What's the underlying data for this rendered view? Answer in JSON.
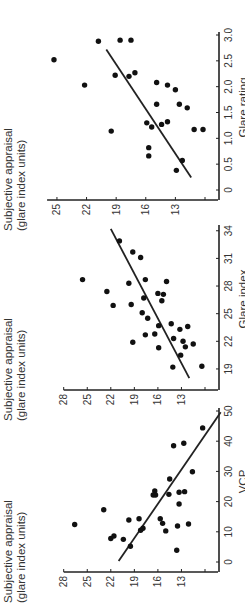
{
  "figure": {
    "panel_count": 3,
    "colors": {
      "point": "#111111",
      "axis": "#222222",
      "line": "#222222",
      "text": "#333333"
    }
  },
  "chart_data": [
    {
      "type": "scatter",
      "title": "",
      "xlabel": "VCP",
      "ylabel": "Subjective appraisal (glare index units)",
      "ylabel_lines": [
        "Subjective appraisal",
        "(glare index units)"
      ],
      "xlim": [
        0,
        50
      ],
      "ylim": [
        10,
        28
      ],
      "xticks": [
        0,
        10,
        20,
        30,
        40,
        50
      ],
      "yticks": [
        13,
        16,
        19,
        22,
        25,
        28
      ],
      "ytick_marks": [
        10,
        13,
        16,
        19,
        22,
        25,
        28
      ],
      "grid": false,
      "points": [
        [
          12.4,
          26.6
        ],
        [
          17.3,
          22.9
        ],
        [
          7.8,
          22.0
        ],
        [
          8.6,
          21.6
        ],
        [
          7.5,
          20.4
        ],
        [
          5.2,
          19.5
        ],
        [
          13.9,
          19.7
        ],
        [
          14.3,
          18.4
        ],
        [
          10.5,
          18.2
        ],
        [
          11.2,
          17.9
        ],
        [
          23.5,
          16.4
        ],
        [
          22.2,
          16.3
        ],
        [
          22.2,
          16.6
        ],
        [
          27.5,
          14.5
        ],
        [
          38.5,
          14.0
        ],
        [
          39.3,
          12.7
        ],
        [
          22.4,
          14.6
        ],
        [
          23.1,
          13.3
        ],
        [
          23.3,
          12.6
        ],
        [
          19.2,
          13.3
        ],
        [
          29.9,
          11.6
        ],
        [
          44.4,
          10.3
        ],
        [
          14.3,
          15.7
        ],
        [
          12.8,
          15.4
        ],
        [
          10.3,
          15.0
        ],
        [
          11.9,
          13.5
        ],
        [
          12.6,
          12.1
        ],
        [
          3.9,
          13.6
        ]
      ],
      "regression_line": [
        [
          0.3,
          21.0
        ],
        [
          49.6,
          8.0
        ]
      ]
    },
    {
      "type": "scatter",
      "title": "",
      "xlabel": "Glare index",
      "ylabel": "Subjective appraisal (glare index units)",
      "ylabel_lines": [
        "Subjective appraisal",
        "(glare index units)"
      ],
      "xlim": [
        17.8,
        34.3
      ],
      "ylim": [
        10,
        28
      ],
      "xticks": [
        19,
        22,
        25,
        28,
        31,
        34
      ],
      "yticks": [
        13,
        16,
        19,
        22,
        25,
        28
      ],
      "ytick_marks": [
        10,
        13,
        16,
        19,
        22,
        25,
        28
      ],
      "grid": false,
      "points": [
        [
          28.7,
          25.6
        ],
        [
          32.9,
          20.9
        ],
        [
          31.7,
          19.2
        ],
        [
          31.1,
          18.2
        ],
        [
          27.4,
          22.5
        ],
        [
          25.9,
          21.7
        ],
        [
          28.3,
          19.7
        ],
        [
          28.7,
          17.6
        ],
        [
          28.5,
          14.9
        ],
        [
          26.0,
          19.4
        ],
        [
          26.7,
          17.8
        ],
        [
          27.2,
          16.0
        ],
        [
          27.1,
          15.3
        ],
        [
          26.4,
          15.5
        ],
        [
          25.1,
          18.0
        ],
        [
          24.5,
          17.3
        ],
        [
          23.7,
          15.9
        ],
        [
          23.9,
          14.3
        ],
        [
          21.9,
          19.2
        ],
        [
          22.7,
          17.6
        ],
        [
          22.8,
          16.4
        ],
        [
          21.3,
          15.9
        ],
        [
          22.3,
          14.0
        ],
        [
          23.3,
          13.2
        ],
        [
          23.6,
          12.2
        ],
        [
          22.0,
          12.8
        ],
        [
          21.4,
          12.5
        ],
        [
          21.7,
          11.5
        ],
        [
          20.5,
          13.1
        ],
        [
          19.2,
          14.1
        ],
        [
          19.3,
          10.4
        ]
      ],
      "regression_line": [
        [
          18.0,
          12.0
        ],
        [
          34.2,
          22.0
        ]
      ]
    },
    {
      "type": "scatter",
      "title": "",
      "xlabel": "Glare rating",
      "ylabel": "Subjective appraisal (glare index units)",
      "ylabel_lines": [
        "Subjective appraisal",
        "(glare index units)"
      ],
      "xlim": [
        0,
        3.0
      ],
      "ylim": [
        10,
        26
      ],
      "xticks": [
        0,
        0.5,
        1.0,
        1.5,
        2.0,
        2.5,
        3.0
      ],
      "xtick_labels": [
        "0",
        "0.5",
        "1.0",
        "1.5",
        "2.0",
        "2.5",
        "3.0"
      ],
      "yticks": [
        13,
        16,
        19,
        22,
        25
      ],
      "ytick_marks": [
        10,
        13,
        16,
        19,
        22,
        25
      ],
      "grid": false,
      "points": [
        [
          2.52,
          25.3
        ],
        [
          2.03,
          22.2
        ],
        [
          2.88,
          20.8
        ],
        [
          2.9,
          18.6
        ],
        [
          2.9,
          17.5
        ],
        [
          1.14,
          19.5
        ],
        [
          2.22,
          19.1
        ],
        [
          2.2,
          17.7
        ],
        [
          2.27,
          17.1
        ],
        [
          2.08,
          14.9
        ],
        [
          2.03,
          13.8
        ],
        [
          1.94,
          13.0
        ],
        [
          1.66,
          14.9
        ],
        [
          1.66,
          12.6
        ],
        [
          1.59,
          11.8
        ],
        [
          1.3,
          15.9
        ],
        [
          1.22,
          15.4
        ],
        [
          1.27,
          14.4
        ],
        [
          1.32,
          13.8
        ],
        [
          1.17,
          11.1
        ],
        [
          1.17,
          10.2
        ],
        [
          0.82,
          15.7
        ],
        [
          0.66,
          15.7
        ],
        [
          0.57,
          12.3
        ],
        [
          0.38,
          12.9
        ]
      ],
      "regression_line": [
        [
          0.24,
          11.4
        ],
        [
          2.72,
          20.0
        ]
      ]
    }
  ],
  "layout": {
    "panels": [
      {
        "x0": 49,
        "x1": 200,
        "y_top": 569,
        "y_bottom": 205,
        "ytop_px": 42,
        "ybottom_px": 184
      },
      {
        "x0": 231,
        "x1": 383,
        "y_top": 380,
        "ybottom_px": 184
      },
      {
        "x0": 421,
        "x1": 576,
        "y_top": 188
      }
    ]
  }
}
